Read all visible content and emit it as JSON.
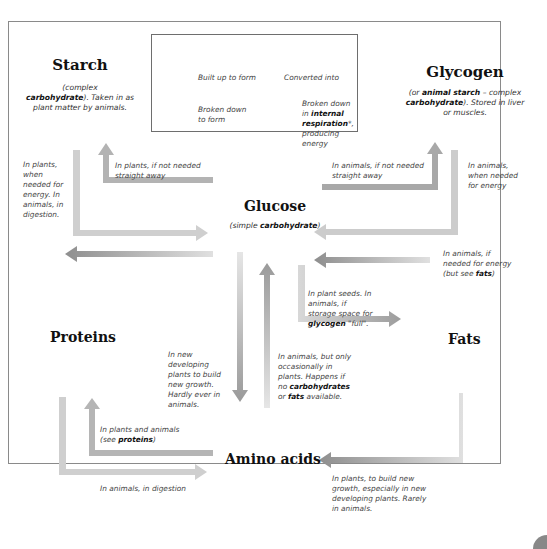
{
  "legend": {
    "built_up": "Built up to form",
    "converted": "Converted into",
    "broken_down": [
      "Broken down",
      "to form"
    ],
    "respiration": {
      "pre": "Broken down",
      "in": "in ",
      "bold": "internal respiration",
      "post": "*,",
      "line3": "producing energy"
    }
  },
  "nodes": {
    "starch": {
      "title": "Starch",
      "desc_pre": "(complex",
      "desc_bold": "carbohydrate",
      "desc_post": "). Taken in as plant matter by animals."
    },
    "glycogen": {
      "title": "Glycogen",
      "desc_pre": "(or ",
      "desc_bold1": "animal starch",
      "desc_mid": " – complex ",
      "desc_bold2": "carbohydrate",
      "desc_post": "). Stored in liver or muscles."
    },
    "glucose": {
      "title": "Glucose",
      "desc_pre": "(simple ",
      "desc_bold": "carbohydrate",
      "desc_post": ")"
    },
    "proteins": {
      "title": "Proteins"
    },
    "fats": {
      "title": "Fats"
    },
    "amino_acids": {
      "title": "Amino acids"
    }
  },
  "notes": {
    "starch_to_glucose": "In plants, when needed for energy. In animals, in digestion.",
    "glucose_to_starch": "In plants, if not needed straight away",
    "glucose_to_glycogen": "In animals, if not needed straight away",
    "glycogen_to_glucose": "In animals, when needed for energy",
    "fats_to_glucose": {
      "pre": "In animals, if needed for energy (but see ",
      "bold": "fats",
      "post": ")"
    },
    "glucose_to_fats": {
      "pre": "In plant seeds. In animals, if storage space for ",
      "bold": "glycogen",
      "post": " \"full\"."
    },
    "glucose_to_amino": "In new developing plants to build new growth. Hardly ever in animals.",
    "amino_to_glucose": {
      "pre": "In animals, but only occasionally in plants. Happens if no ",
      "bold1": "carbohydrates",
      "mid": " or ",
      "bold2": "fats",
      "post": " available."
    },
    "amino_to_proteins": {
      "pre": "In plants and animals (see ",
      "bold": "proteins",
      "post": ")"
    },
    "proteins_to_amino": "In animals, in digestion",
    "fats_to_amino": "In plants, to build new growth, especially in new developing plants. Rarely in animals."
  },
  "colors": {
    "built_up": "#9a9a9a",
    "converted": "#b5b5b5",
    "broken_down": "#c8c8c8",
    "respiration": "#8c8c8c"
  }
}
